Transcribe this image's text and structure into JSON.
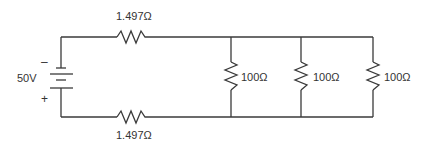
{
  "diagram": {
    "type": "circuit-schematic",
    "source": {
      "voltage_label": "50V",
      "negative_label": "–",
      "positive_label": "+"
    },
    "series_resistors": {
      "top_label": "1.497Ω",
      "bottom_label": "1.497Ω"
    },
    "parallel_resistors": [
      {
        "label": "100Ω"
      },
      {
        "label": "100Ω"
      },
      {
        "label": "100Ω"
      }
    ],
    "colors": {
      "wire": "#3a3a3a",
      "text": "#333333",
      "background": "#ffffff"
    }
  }
}
